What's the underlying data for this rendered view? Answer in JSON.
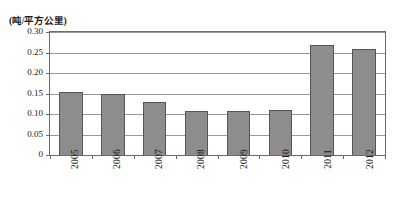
{
  "chart_data": {
    "type": "bar",
    "title": "",
    "subtitle": "",
    "xlabel": "",
    "ylabel": "(吨/平方公里)",
    "unit_caption": "(吨/平方公里)",
    "categories": [
      "2005",
      "2006",
      "2007",
      "2008",
      "2009",
      "2010",
      "2011",
      "2012"
    ],
    "values": [
      0.153,
      0.15,
      0.129,
      0.108,
      0.107,
      0.111,
      0.268,
      0.259
    ],
    "series": [
      {
        "name": "",
        "values": [
          0.153,
          0.15,
          0.129,
          0.108,
          0.107,
          0.111,
          0.268,
          0.259
        ]
      }
    ],
    "ylim": [
      0,
      0.3
    ],
    "yticks": [
      0,
      0.05,
      0.1,
      0.15,
      0.2,
      0.25,
      0.3
    ],
    "ytick_labels": [
      "0",
      "0.05",
      "0.10",
      "0.15",
      "0.20",
      "0.25",
      "0.30"
    ],
    "xtick_labels_rotation": 90,
    "grid": "horizontal",
    "legend": "none",
    "bar_color": "#8d8d8d",
    "bar_edge_color": "#555555",
    "gridline_color": "#9a9a9a",
    "frame_color": "#6a6a6a",
    "background_color": "#ffffff"
  }
}
